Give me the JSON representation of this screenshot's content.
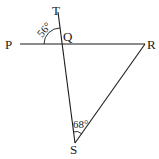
{
  "diagram": {
    "type": "geometry",
    "points": {
      "P": {
        "label": "P",
        "x": 8,
        "y": 48
      },
      "Q": {
        "label": "Q",
        "x": 67,
        "y": 31
      },
      "R": {
        "label": "R",
        "x": 147,
        "y": 49
      },
      "S": {
        "label": "S",
        "x": 69,
        "y": 153
      },
      "T": {
        "label": "T",
        "x": 52,
        "y": 15
      }
    },
    "angles": [
      {
        "id": "angle-TQP",
        "label": "56°",
        "vertex": "Q"
      },
      {
        "id": "angle-QSR",
        "label": "68°",
        "vertex": "S"
      }
    ],
    "lines": [
      {
        "id": "line-PR",
        "from": "P",
        "to": "R"
      },
      {
        "id": "line-TS",
        "from": "T",
        "to": "S"
      },
      {
        "id": "line-RS",
        "from": "R",
        "to": "S"
      }
    ],
    "stroke_color": "#1a1a1a"
  }
}
